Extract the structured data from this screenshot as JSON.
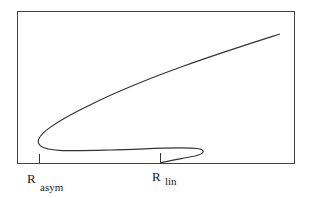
{
  "diagram": {
    "type": "bifurcation-curve",
    "frame": {
      "x": 17,
      "y": 11,
      "width": 277,
      "height": 152,
      "stroke": "#333333"
    },
    "curve_color": "#333333",
    "labels": [
      {
        "main": "R",
        "sub": "asym",
        "tick_x": 39
      },
      {
        "main": "R",
        "sub": "lin",
        "tick_x": 160
      }
    ]
  }
}
